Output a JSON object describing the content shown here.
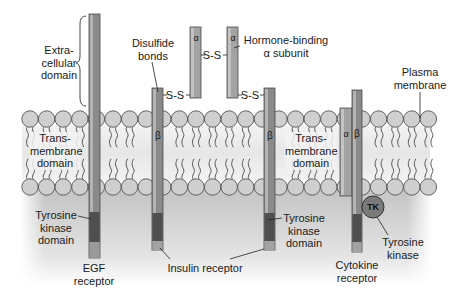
{
  "colors": {
    "background": "#ffffff",
    "cytoplasm_gray": "#c9c9c9",
    "lipid_head": "#cfcfcf",
    "lipid_head_stroke": "#555555",
    "receptor_body": "#8a8a8a",
    "receptor_highlight": "#b5b5b5",
    "kinase_domain": "#4f4f4f",
    "alpha_subunit": "#9c9c9c",
    "tk_circle": "#7a7a7a"
  },
  "labels": {
    "extracellular": [
      "Extra-",
      "cellular",
      "domain"
    ],
    "transmembrane_left": [
      "Trans-",
      "membrane",
      "domain"
    ],
    "transmembrane_right": [
      "Trans-",
      "membrane",
      "domain"
    ],
    "disulfide": [
      "Disulfide",
      "bonds"
    ],
    "hormone_binding": [
      "Hormone-binding",
      "α subunit"
    ],
    "plasma_membrane": [
      "Plasma",
      "membrane"
    ],
    "tyrosine_kinase_domain_left": [
      "Tyrosine",
      "kinase",
      "domain"
    ],
    "tyrosine_kinase_domain_right": [
      "Tyrosine",
      "kinase",
      "domain"
    ],
    "egf_receptor": [
      "EGF",
      "receptor"
    ],
    "insulin_receptor": "Insulin receptor",
    "cytokine_receptor": [
      "Cytokine",
      "receptor"
    ],
    "tyrosine_kinase": [
      "Tyrosine",
      "kinase"
    ]
  },
  "glyphs": {
    "alpha": "α",
    "beta": "β",
    "ss_bond": "S-S",
    "tk": "TK"
  }
}
